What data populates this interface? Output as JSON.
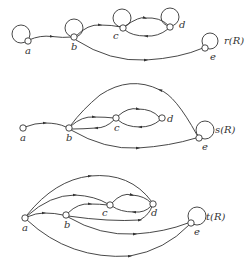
{
  "diagrams": [
    {
      "title": "r(R)",
      "nodes": {
        "a": {
          "label": "a"
        },
        "b": {
          "label": "b"
        },
        "c": {
          "label": "c"
        },
        "d": {
          "label": "d"
        },
        "e": {
          "label": "e"
        }
      },
      "edges": [
        "a→b",
        "b→c",
        "c→d",
        "d→c",
        "b→e",
        "a→a",
        "b→b",
        "c→c",
        "d→d",
        "e→e"
      ]
    },
    {
      "title": "s(R)",
      "nodes": {
        "a": {
          "label": "a"
        },
        "b": {
          "label": "b"
        },
        "c": {
          "label": "c"
        },
        "d": {
          "label": "d"
        },
        "e": {
          "label": "e"
        }
      },
      "edges": [
        "a→b",
        "b→c",
        "c→b",
        "c→d",
        "d→c",
        "b→e",
        "e→b",
        "e→e"
      ]
    },
    {
      "title": "t(R)",
      "nodes": {
        "a": {
          "label": "a"
        },
        "b": {
          "label": "b"
        },
        "c": {
          "label": "c"
        },
        "d": {
          "label": "d"
        },
        "e": {
          "label": "e"
        }
      },
      "edges": [
        "a→b",
        "a→c",
        "a→d",
        "a→e",
        "b→c",
        "b→d",
        "b→e",
        "c→d",
        "d→c",
        "e→e"
      ]
    }
  ]
}
